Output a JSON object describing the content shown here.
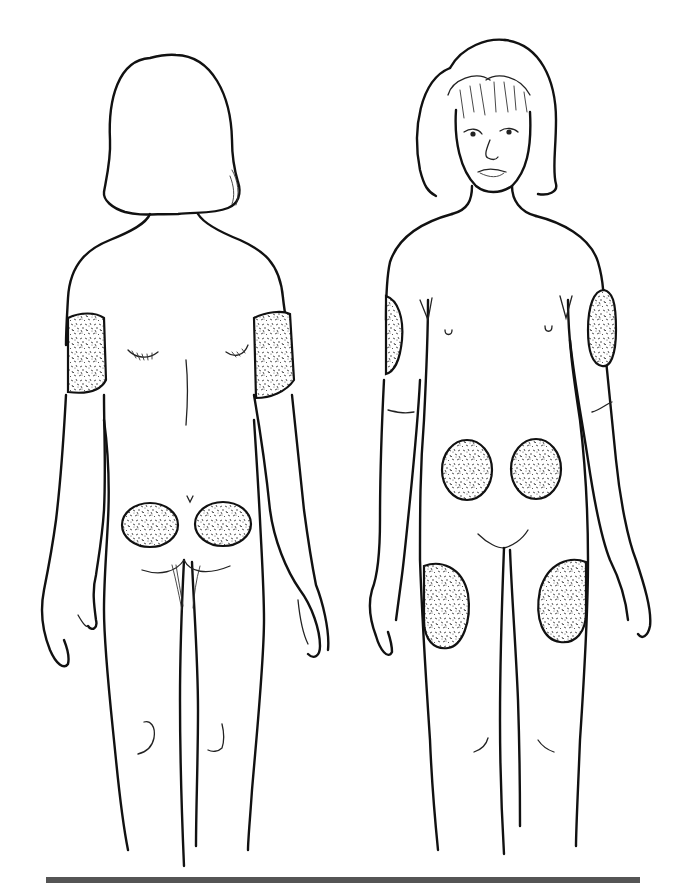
{
  "diagram": {
    "subject": "Child body outline, back and front views, with shaded injection sites",
    "views": [
      {
        "id": "back",
        "label": "Back view",
        "injection_sites": [
          {
            "name": "right-upper-arm-back",
            "shape": "band"
          },
          {
            "name": "left-upper-arm-back",
            "shape": "band"
          },
          {
            "name": "left-buttock",
            "shape": "oval"
          },
          {
            "name": "right-buttock",
            "shape": "oval"
          }
        ]
      },
      {
        "id": "front",
        "label": "Front view",
        "injection_sites": [
          {
            "name": "right-upper-arm-outer",
            "shape": "oval"
          },
          {
            "name": "left-upper-arm-outer",
            "shape": "oval"
          },
          {
            "name": "right-abdomen",
            "shape": "oval"
          },
          {
            "name": "left-abdomen",
            "shape": "oval"
          },
          {
            "name": "right-thigh",
            "shape": "oval"
          },
          {
            "name": "left-thigh",
            "shape": "oval"
          }
        ]
      }
    ],
    "site_count": 10
  },
  "colors": {
    "line": "#111111",
    "stipple": "#444444",
    "background": "#ffffff",
    "rule": "#555555"
  }
}
